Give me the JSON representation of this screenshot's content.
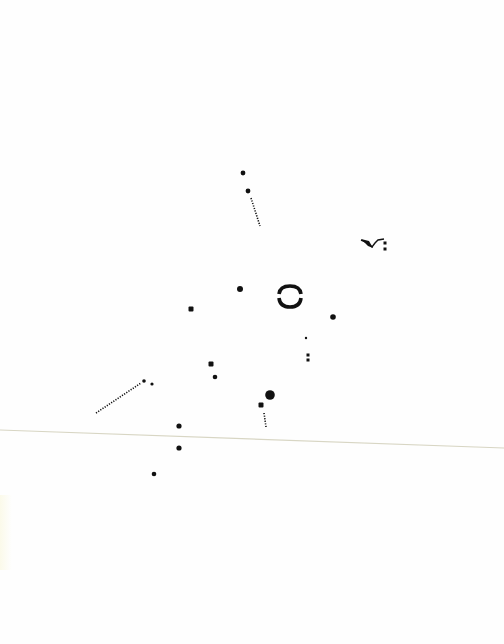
{
  "page": {
    "kind": "scanned sheet of abstract dot-notation artwork",
    "paper_color": "#fefefe",
    "ink_color": "#111111",
    "fold_line_color": "#d8d6c4"
  },
  "marks": [
    {
      "id": "dot-top",
      "type": "dot"
    },
    {
      "id": "dot-top-trail-head",
      "type": "dot"
    },
    {
      "id": "dotted-trail-top",
      "type": "dotted-line"
    },
    {
      "id": "hook-mark",
      "type": "hook-with-dash"
    },
    {
      "id": "hook-colon",
      "type": "double-dot"
    },
    {
      "id": "square-left",
      "type": "square"
    },
    {
      "id": "dot-center",
      "type": "dot"
    },
    {
      "id": "ring-mark",
      "type": "broken-ring"
    },
    {
      "id": "dot-right",
      "type": "dot"
    },
    {
      "id": "speck-right",
      "type": "small-dot"
    },
    {
      "id": "colon-right",
      "type": "double-dot"
    },
    {
      "id": "square-mid",
      "type": "square"
    },
    {
      "id": "dot-mid",
      "type": "dot"
    },
    {
      "id": "dotted-trail-left",
      "type": "dotted-line"
    },
    {
      "id": "dot-trail-left-a",
      "type": "dot"
    },
    {
      "id": "dot-trail-left-b",
      "type": "small-dot"
    },
    {
      "id": "dot-large",
      "type": "large-dot"
    },
    {
      "id": "square-lower",
      "type": "square"
    },
    {
      "id": "dotted-trail-lower",
      "type": "dotted-line"
    },
    {
      "id": "dot-lower-a",
      "type": "dot"
    },
    {
      "id": "dot-lower-b",
      "type": "dot"
    },
    {
      "id": "dot-lower-c",
      "type": "dot"
    },
    {
      "id": "fold-line",
      "type": "crease"
    }
  ]
}
